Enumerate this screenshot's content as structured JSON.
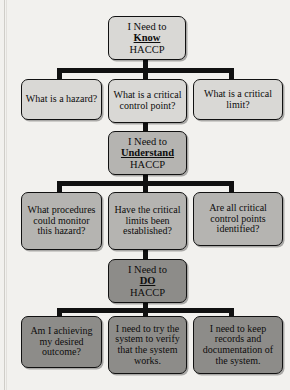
{
  "diagram": {
    "type": "flowchart",
    "orientation": "top-down",
    "tiers": [
      {
        "id": "know",
        "header": {
          "line1": "I Need to",
          "keyword": "Know",
          "line3": "HACCP"
        },
        "children": [
          {
            "id": "hazard",
            "text": "What is a hazard?"
          },
          {
            "id": "ccp",
            "text": "What is a critical control point?"
          },
          {
            "id": "limit",
            "text": "What is a critical limit?"
          }
        ]
      },
      {
        "id": "understand",
        "header": {
          "line1": "I Need to",
          "keyword": "Understand",
          "line3": "HACCP"
        },
        "children": [
          {
            "id": "procedures",
            "text": "What procedures could monitor this hazard?"
          },
          {
            "id": "crit-limits",
            "text": "Have the critical limits been established?"
          },
          {
            "id": "all-ccp",
            "text": "Are all critical control points identified?"
          }
        ]
      },
      {
        "id": "do",
        "header": {
          "line1": "I Need to",
          "keyword": "DO",
          "line3": "HACCP"
        },
        "children": [
          {
            "id": "outcome",
            "text": "Am I achieving my desired outcome?"
          },
          {
            "id": "verify",
            "text": "I need to try the system to verify that the system works."
          },
          {
            "id": "records",
            "text": "I need to keep records and documentation of the system."
          }
        ]
      }
    ],
    "colors": {
      "page_background": "#f2f1ee",
      "tier_know_fill": "#d9d8d5",
      "tier_understand_fill": "#b5b4b1",
      "tier_do_fill": "#8d8c89",
      "outline": "#111111",
      "text": "#0d0d0d"
    }
  }
}
